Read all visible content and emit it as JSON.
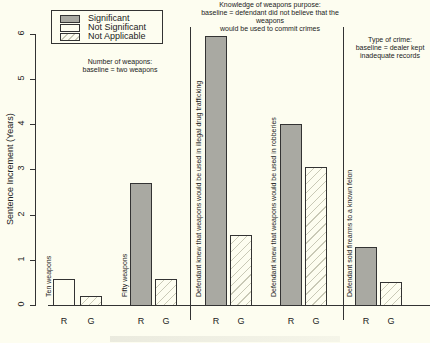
{
  "chart_data": {
    "type": "bar",
    "title": "",
    "xlabel": "",
    "ylabel": "Sentence Increment (Years)",
    "ylim": [
      0,
      6
    ],
    "yticks": [
      "0",
      "1",
      "2",
      "3",
      "4",
      "5",
      "6"
    ],
    "legend": {
      "position": "top-left",
      "entries": [
        {
          "label": "Significant",
          "fill": "#a9a9a2"
        },
        {
          "label": "Not Significant",
          "fill": "#fdfdf0"
        },
        {
          "label": "Not Applicable",
          "fill": "hatched"
        }
      ]
    },
    "groups": [
      {
        "title": "Number of weapons:\nbaseline = two weapons",
        "categories": [
          {
            "label": "Ten weapons",
            "bars": [
              {
                "x": "R",
                "value": 0.57,
                "status": "Not Significant"
              },
              {
                "x": "G",
                "value": 0.2,
                "status": "Not Applicable"
              }
            ]
          },
          {
            "label": "Fifty weapons",
            "bars": [
              {
                "x": "R",
                "value": 2.7,
                "status": "Significant"
              },
              {
                "x": "G",
                "value": 0.57,
                "status": "Not Applicable"
              }
            ]
          }
        ]
      },
      {
        "title": "Knowledge of weapons purpose:\nbaseline = defendant did not believe that the weapons\nwould be used to commit crimes",
        "categories": [
          {
            "label": "Defendant knew that weapons would be used in illegal drug trafficking",
            "bars": [
              {
                "x": "R",
                "value": 5.95,
                "status": "Significant"
              },
              {
                "x": "G",
                "value": 1.55,
                "status": "Not Applicable"
              }
            ]
          },
          {
            "label": "Defendant knew that weapons would be used in robberies",
            "bars": [
              {
                "x": "R",
                "value": 4.0,
                "status": "Significant"
              },
              {
                "x": "G",
                "value": 3.05,
                "status": "Not Applicable"
              }
            ]
          }
        ]
      },
      {
        "title": "Type of crime:\nbaseline = dealer kept\ninadequate records",
        "categories": [
          {
            "label": "Defendant sold firearms to a known felon",
            "bars": [
              {
                "x": "R",
                "value": 1.28,
                "status": "Significant"
              },
              {
                "x": "G",
                "value": 0.5,
                "status": "Not Applicable"
              }
            ]
          }
        ]
      }
    ],
    "grid": false
  },
  "labels": {
    "ylabel": "Sentence Increment (Years)",
    "legend": [
      "Significant",
      "Not Significant",
      "Not Applicable"
    ],
    "group1_title_l1": "Number of weapons:",
    "group1_title_l2": "baseline = two weapons",
    "group2_title_l1": "Knowledge of weapons purpose:",
    "group2_title_l2": "baseline = defendant did not believe that the weapons",
    "group2_title_l3": "would be used to commit crimes",
    "group3_title_l1": "Type of crime:",
    "group3_title_l2": "baseline = dealer kept",
    "group3_title_l3": "inadequate records",
    "cat_ten": "Ten weapons",
    "cat_fifty": "Fifty weapons",
    "cat_drug": "Defendant knew that weapons would be used in illegal drug trafficking",
    "cat_rob": "Defendant knew that weapons would be used in robberies",
    "cat_felon": "Defendant sold firearms to a known felon",
    "r": "R",
    "g": "G",
    "yticks": [
      "0",
      "1",
      "2",
      "3",
      "4",
      "5",
      "6"
    ]
  }
}
